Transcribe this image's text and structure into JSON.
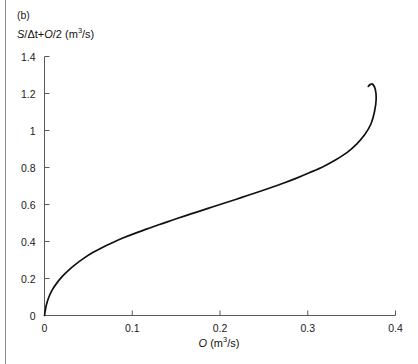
{
  "figure": {
    "panel_label": "(b)",
    "y_axis_title_parts": {
      "s": "S",
      "slash_delta_t": "/Δt",
      "plus": "+",
      "o": "O",
      "over_two": "/2",
      "units_prefix": " (m",
      "units_sup": "3",
      "units_suffix": "/s)"
    },
    "x_axis_title_parts": {
      "o": "O",
      "units_prefix": " (m",
      "units_sup": "3",
      "units_suffix": "/s)"
    },
    "line_color": "#111111",
    "axis_color": "#595959"
  },
  "chart_data": {
    "type": "line",
    "title": "(b)",
    "subtitle": "",
    "xlabel": "O (m³/s)",
    "ylabel": "S/Δt + O/2 (m³/s)",
    "xlim": [
      0,
      0.4
    ],
    "ylim": [
      0,
      1.4
    ],
    "xticks": [
      0,
      0.1,
      0.2,
      0.3,
      0.4
    ],
    "xtick_labels": [
      "0",
      "0.1",
      "0.2",
      "0.3",
      "0.4"
    ],
    "yticks": [
      0,
      0.2,
      0.4,
      0.6,
      0.8,
      1.0,
      1.2,
      1.4
    ],
    "ytick_labels": [
      "0",
      "0.2",
      "0.4",
      "0.6",
      "0.8",
      "1",
      "1.2",
      "1.4"
    ],
    "grid": false,
    "legend": null,
    "annotations": [],
    "series": [
      {
        "name": "storage-outflow relation",
        "x": [
          0.0,
          0.002,
          0.005,
          0.009,
          0.014,
          0.02,
          0.027,
          0.035,
          0.045,
          0.055,
          0.066,
          0.078,
          0.09,
          0.103,
          0.117,
          0.131,
          0.146,
          0.161,
          0.176,
          0.192,
          0.208,
          0.224,
          0.24,
          0.256,
          0.272,
          0.288,
          0.303,
          0.318,
          0.332,
          0.345,
          0.356,
          0.365,
          0.372,
          0.376,
          0.378,
          0.377,
          0.374,
          0.371,
          0.369
        ],
        "y": [
          0.0,
          0.055,
          0.1,
          0.14,
          0.175,
          0.21,
          0.243,
          0.275,
          0.31,
          0.34,
          0.368,
          0.395,
          0.42,
          0.444,
          0.468,
          0.492,
          0.516,
          0.54,
          0.563,
          0.588,
          0.612,
          0.637,
          0.662,
          0.688,
          0.715,
          0.744,
          0.774,
          0.806,
          0.842,
          0.882,
          0.928,
          0.978,
          1.035,
          1.1,
          1.17,
          1.222,
          1.25,
          1.248,
          1.238
        ]
      }
    ]
  }
}
